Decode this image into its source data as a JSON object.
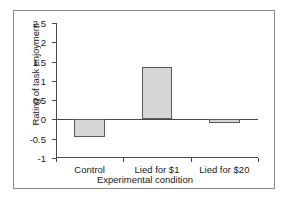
{
  "chart_data": {
    "type": "bar",
    "title": "",
    "categories": [
      "Control",
      "Lied for $1",
      "Lied for $20"
    ],
    "values": [
      -0.45,
      1.35,
      -0.08
    ],
    "series": [
      {
        "name": "Rating of task enjoyment",
        "values": [
          -0.45,
          1.35,
          -0.08
        ]
      }
    ],
    "xlabel": "Experimental condition",
    "ylabel": "Rating of task enjoyment",
    "ylim": [
      -1,
      2.5
    ],
    "yticks": [
      2.5,
      2,
      1.5,
      1,
      0.5,
      0,
      -0.5,
      -1
    ],
    "ytick_labels": [
      "2.5",
      "2",
      "1.5",
      "1",
      "0.5",
      "0",
      "-0.5",
      "-1"
    ],
    "grid": false,
    "legend": null,
    "bar_color": "#d6d6d6",
    "bar_edge_color": "#5a5a5a",
    "axis_color": "#4a4a4a",
    "zero_line": 0
  }
}
